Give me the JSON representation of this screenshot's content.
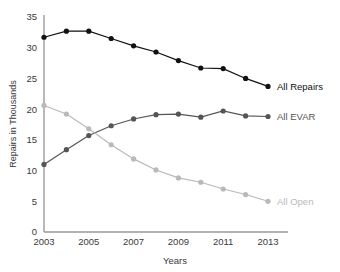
{
  "chart_data": {
    "type": "line",
    "title": "",
    "xlabel": "Years",
    "ylabel": "Repairs in Thousands",
    "x": [
      2003,
      2004,
      2005,
      2006,
      2007,
      2008,
      2009,
      2010,
      2011,
      2012,
      2013
    ],
    "xticks": [
      "2003",
      "2005",
      "2007",
      "2009",
      "2011",
      "2013"
    ],
    "xtick_values": [
      2003,
      2005,
      2007,
      2009,
      2011,
      2013
    ],
    "yticks": [
      "0",
      "5",
      "10",
      "15",
      "20",
      "25",
      "30",
      "35"
    ],
    "ytick_values": [
      0,
      5,
      10,
      15,
      20,
      25,
      30,
      35
    ],
    "xlim": [
      2003,
      2013
    ],
    "ylim": [
      0,
      35
    ],
    "grid": false,
    "legend_position": "right-inline",
    "series": [
      {
        "name": "All Repairs",
        "color": "#111111",
        "label": "All Repairs",
        "values": [
          31.7,
          32.7,
          32.7,
          31.5,
          30.3,
          29.3,
          27.9,
          26.7,
          26.6,
          25.0,
          23.7
        ]
      },
      {
        "name": "All EVAR",
        "color": "#555555",
        "label": "All EVAR",
        "values": [
          11.0,
          13.4,
          15.7,
          17.3,
          18.4,
          19.1,
          19.2,
          18.7,
          19.7,
          18.9,
          18.8
        ]
      },
      {
        "name": "All Open",
        "color": "#b9b9b9",
        "label": "All Open",
        "values": [
          20.6,
          19.2,
          16.8,
          14.2,
          11.9,
          10.1,
          8.8,
          8.1,
          7.0,
          6.1,
          5.0
        ]
      }
    ]
  },
  "axes": {
    "x_title": "Years",
    "y_title": "Repairs in Thousands"
  }
}
